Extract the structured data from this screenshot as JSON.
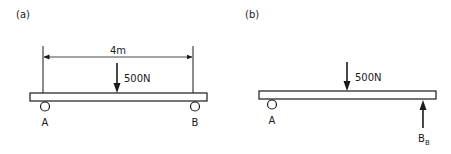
{
  "panels": [
    {
      "id": "a",
      "label": "(a)",
      "dimension": "4m",
      "load": "500N",
      "support_left": "A",
      "support_right": "B"
    },
    {
      "id": "b",
      "label": "(b)",
      "load": "500N",
      "support_left": "A",
      "reaction_label": "B",
      "reaction_subscript": "B"
    }
  ],
  "colors": {
    "stroke": "#1a1a1a",
    "fill": "#ffffff"
  }
}
